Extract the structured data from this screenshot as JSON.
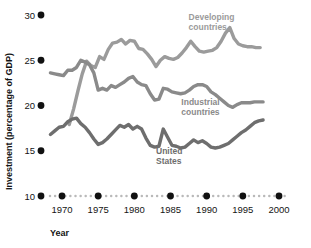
{
  "chart_data": {
    "type": "line",
    "title": "",
    "xlabel": "Year",
    "ylabel": "Investment (percentage of GDP)",
    "xlim": [
      1968,
      2001
    ],
    "ylim": [
      10,
      30
    ],
    "xticks": [
      1970,
      1975,
      1980,
      1985,
      1990,
      1995,
      2000
    ],
    "xtick_labels": [
      "1970",
      "1975",
      "1980",
      "1985",
      "1990",
      "1995",
      "2000"
    ],
    "yticks": [
      10,
      15,
      20,
      25,
      30
    ],
    "ytick_labels": [
      "10",
      "15",
      "20",
      "25",
      "30"
    ],
    "grid": false,
    "legend_position": "inline-annotations",
    "axis_style": "dotted-baseline-with-dot-ticks",
    "series": [
      {
        "name": "Developing countries",
        "color": "#9b9b9b",
        "label_x": 1987.5,
        "label_y": 29.4,
        "x": [
          1971,
          1971.6,
          1972.2,
          1972.8,
          1973.4,
          1974,
          1974.6,
          1975.2,
          1975.8,
          1976.4,
          1977,
          1977.6,
          1978.2,
          1978.8,
          1979.4,
          1980,
          1980.6,
          1981.2,
          1981.8,
          1982.4,
          1983,
          1983.6,
          1984.2,
          1984.8,
          1985.4,
          1986,
          1986.6,
          1987.2,
          1987.8,
          1988.4,
          1989,
          1989.6,
          1990.2,
          1990.8,
          1991.4,
          1992,
          1992.6,
          1993.2,
          1993.8,
          1994.4,
          1995,
          1995.6,
          1996.2,
          1996.8,
          1997.4
        ],
        "y": [
          17.9,
          19.6,
          21.6,
          23.5,
          24.9,
          24.4,
          24.2,
          25.4,
          25.1,
          26.2,
          26.9,
          27.0,
          27.3,
          26.8,
          27.2,
          27.1,
          26.3,
          26.2,
          25.7,
          25.1,
          24.3,
          25.0,
          25.4,
          25.2,
          25.1,
          25.3,
          25.8,
          26.4,
          27.1,
          26.5,
          26.0,
          25.9,
          26.0,
          26.1,
          26.4,
          27.1,
          28.0,
          28.6,
          27.4,
          26.8,
          26.6,
          26.5,
          26.5,
          26.4,
          26.4
        ]
      },
      {
        "name": "Industrial countries",
        "color": "#8a8a8a",
        "label_x": 1986.5,
        "label_y": 20.1,
        "x": [
          1968.4,
          1969,
          1969.6,
          1970.2,
          1970.8,
          1971.4,
          1972,
          1972.6,
          1973.2,
          1973.8,
          1974.4,
          1975,
          1975.6,
          1976.2,
          1976.8,
          1977.4,
          1978,
          1978.6,
          1979.2,
          1979.8,
          1980.4,
          1981,
          1981.6,
          1982.2,
          1982.8,
          1983.4,
          1984,
          1984.6,
          1985.2,
          1985.8,
          1986.4,
          1987,
          1987.6,
          1988.2,
          1988.8,
          1989.4,
          1990,
          1990.6,
          1991.2,
          1991.8,
          1992.4,
          1993,
          1993.6,
          1994.2,
          1994.8,
          1995.4,
          1996,
          1996.6,
          1997.2,
          1997.8
        ],
        "y": [
          23.6,
          23.5,
          23.4,
          23.3,
          23.9,
          23.9,
          24.2,
          25.0,
          24.8,
          24.5,
          23.6,
          21.7,
          21.9,
          21.7,
          22.2,
          22.0,
          22.3,
          22.6,
          23.0,
          23.2,
          22.6,
          22.3,
          22.2,
          21.3,
          20.6,
          20.7,
          21.9,
          21.8,
          21.5,
          21.4,
          21.3,
          21.4,
          21.7,
          22.1,
          22.3,
          22.3,
          22.1,
          21.5,
          21.2,
          20.8,
          20.4,
          20.0,
          19.8,
          20.1,
          20.3,
          20.3,
          20.3,
          20.4,
          20.4,
          20.4
        ]
      },
      {
        "name": "United States",
        "color": "#6e6e6e",
        "label_x": 1983.0,
        "label_y": 14.6,
        "x": [
          1968.4,
          1969,
          1969.6,
          1970.2,
          1970.8,
          1971.4,
          1972,
          1972.6,
          1973.2,
          1973.8,
          1974.4,
          1975,
          1975.6,
          1976.2,
          1976.8,
          1977.4,
          1978,
          1978.6,
          1979.2,
          1979.8,
          1980.4,
          1981,
          1981.6,
          1982.2,
          1982.8,
          1983.4,
          1984,
          1984.6,
          1985.2,
          1985.8,
          1986.4,
          1987,
          1987.6,
          1988.2,
          1988.8,
          1989.4,
          1990,
          1990.6,
          1991.2,
          1991.8,
          1992.4,
          1993,
          1993.6,
          1994.2,
          1994.8,
          1995.4,
          1996,
          1996.6,
          1997.2,
          1997.8
        ],
        "y": [
          16.8,
          17.2,
          17.6,
          17.7,
          18.2,
          18.5,
          18.6,
          18.0,
          17.6,
          17.0,
          16.3,
          15.7,
          15.9,
          16.3,
          16.8,
          17.3,
          17.8,
          17.6,
          17.9,
          17.4,
          17.7,
          17.4,
          16.4,
          15.6,
          15.4,
          15.5,
          17.4,
          16.5,
          15.6,
          15.5,
          15.3,
          15.4,
          15.8,
          16.2,
          15.9,
          16.1,
          15.8,
          15.4,
          15.3,
          15.4,
          15.6,
          15.8,
          16.2,
          16.6,
          17.0,
          17.3,
          17.7,
          18.1,
          18.3,
          18.4
        ]
      }
    ]
  },
  "labels": {
    "developing_line1": "Developing",
    "developing_line2": "countries",
    "industrial_line1": "Industrial",
    "industrial_line2": "countries",
    "us_line1": "United",
    "us_line2": "States"
  }
}
